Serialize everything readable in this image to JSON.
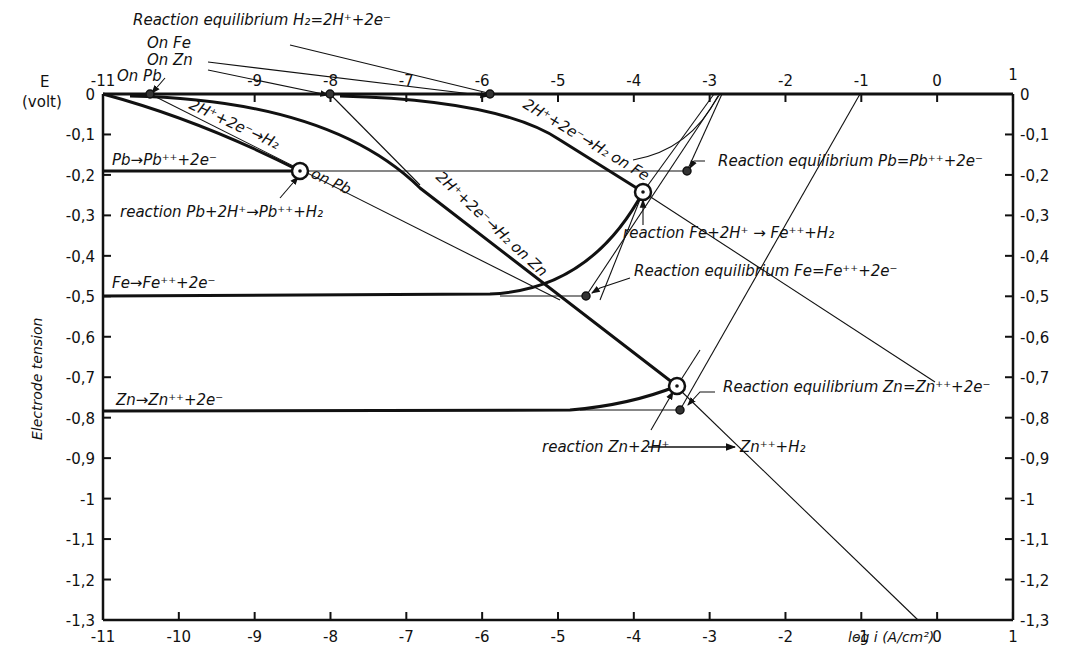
{
  "chart_data": {
    "type": "line",
    "title": "",
    "xlabel": "log i (A/cm²)",
    "ylabel": "Electrode tension",
    "y_unit_label": "E (volt)",
    "xlim": [
      -11,
      1
    ],
    "ylim": [
      -1.3,
      0
    ],
    "grid": false,
    "x_ticks_bottom": [
      "-11",
      "-10",
      "-9",
      "-8",
      "-7",
      "-6",
      "-5",
      "-4",
      "-3",
      "-2",
      "-1",
      "0",
      "1"
    ],
    "x_ticks_top": [
      "-11",
      "-9",
      "-8",
      "-7",
      "-6",
      "-5",
      "-4",
      "-3",
      "-2",
      "-1",
      "0",
      "1"
    ],
    "y_ticks_left": [
      "0",
      "-0,1",
      "-0,2",
      "-0,3",
      "-0,4",
      "-0,5",
      "-0,6",
      "-0,7",
      "-0,8",
      "-0,9",
      "-1",
      "-1,1",
      "-1,2",
      "-1,3"
    ],
    "y_ticks_right": [
      "0",
      "-0,1",
      "-0,2",
      "-0,3",
      "-0,4",
      "-0,5",
      "-0,6",
      "-0,7",
      "-0,8",
      "-0,9",
      "-1",
      "-1,1",
      "-1,2",
      "-1,3"
    ],
    "series": [
      {
        "name": "2H+ + 2e- → H2 on Pb",
        "x": [
          -10.4,
          -9.5,
          -8.4,
          -5.0
        ],
        "y": [
          0,
          -0.08,
          -0.19,
          -0.48
        ]
      },
      {
        "name": "2H+ + 2e- → H2 on Zn",
        "x": [
          -8.0,
          -7.0,
          -5.0,
          -3.4,
          -0.2
        ],
        "y": [
          0,
          -0.18,
          -0.53,
          -0.75,
          -1.3
        ]
      },
      {
        "name": "2H+ + 2e- → H2 on Fe",
        "x": [
          -5.8,
          -4.8,
          -3.8,
          -1.2
        ],
        "y": [
          0,
          -0.14,
          -0.24,
          -0.55
        ]
      },
      {
        "name": "Pb → Pb++ + 2e-",
        "x": [
          -11,
          -8.4,
          -3.3
        ],
        "y": [
          -0.19,
          -0.19,
          -0.19
        ]
      },
      {
        "name": "Fe → Fe++ + 2e-",
        "x": [
          -11,
          -5.0,
          -3.8
        ],
        "y": [
          -0.5,
          -0.49,
          -0.24
        ]
      },
      {
        "name": "Zn → Zn++ + 2e-",
        "x": [
          -11,
          -4.5,
          -3.4
        ],
        "y": [
          -0.82,
          -0.81,
          -0.75
        ]
      }
    ],
    "points": [
      {
        "name": "Pb corrosion point",
        "x": -8.4,
        "y": -0.19
      },
      {
        "name": "Fe corrosion point",
        "x": -3.8,
        "y": -0.24
      },
      {
        "name": "Zn corrosion point",
        "x": -3.4,
        "y": -0.75
      },
      {
        "name": "H2 equilibrium on Pb",
        "x": -10.4,
        "y": 0
      },
      {
        "name": "H2 equilibrium on Zn",
        "x": -8.0,
        "y": 0
      },
      {
        "name": "H2 equilibrium on Fe",
        "x": -5.8,
        "y": 0
      },
      {
        "name": "Pb equilibrium",
        "x": -3.3,
        "y": -0.19
      },
      {
        "name": "Fe equilibrium",
        "x": -4.6,
        "y": -0.5
      },
      {
        "name": "Zn equilibrium",
        "x": -3.3,
        "y": -0.82
      }
    ],
    "annotations": [
      "Reaction equilibrium H₂=2H⁺+2e⁻",
      "On Fe",
      "On Zn",
      "On Pb",
      "2H⁺+2e⁻→H₂ on Pb",
      "2H⁺+2e⁻→H₂ on Fe",
      "2H⁺+2e⁻→H₂ on Zn",
      "Pb→Pb⁺⁺+2e⁻",
      "Fe→Fe⁺⁺+2e⁻",
      "Zn→Zn⁺⁺+2e⁻",
      "reaction Pb+2H⁺→Pb⁺⁺+H₂",
      "reaction Fe+2H⁺→Fe⁺⁺+H₂",
      "reaction Zn+2H⁺→Zn⁺⁺+H₂",
      "Reaction equilibrium Pb=Pb⁺⁺+2e⁻",
      "Reaction equilibrium Fe=Fe⁺⁺+2e⁻",
      "Reaction equilibrium Zn=Zn⁺⁺+2e⁻"
    ]
  },
  "labels": {
    "e_axis": "E",
    "volt": "(volt)",
    "ylabel": "Electrode tension",
    "xlabel": "log i (A/cm²)",
    "h2_eq": "Reaction equilibrium H₂=2H⁺+2e⁻",
    "on_fe": "On Fe",
    "on_zn": "On Zn",
    "on_pb": "On Pb",
    "h2_on_pb": "2H⁺+2e⁻→H₂",
    "on_pb_small": "on Pb",
    "h2_on_fe": "2H⁺+2e⁻→H₂ on Fe",
    "h2_on_zn": "2H⁺+2e⁻→H₂ on Zn",
    "pb_anodic": "Pb→Pb⁺⁺+2e⁻",
    "fe_anodic": "Fe→Fe⁺⁺+2e⁻",
    "zn_anodic": "Zn→Zn⁺⁺+2e⁻",
    "pb_reaction": "reaction Pb+2H⁺→Pb⁺⁺+H₂",
    "fe_reaction": "reaction Fe+2H⁺ → Fe⁺⁺+H₂",
    "zn_reaction_a": "reaction Zn+2H⁺",
    "zn_reaction_b": "Zn⁺⁺+H₂",
    "pb_eq": "Reaction equilibrium Pb=Pb⁺⁺+2e⁻",
    "fe_eq": "Reaction equilibrium Fe=Fe⁺⁺+2e⁻",
    "zn_eq": "Reaction equilibrium Zn=Zn⁺⁺+2e⁻"
  },
  "ticks": {
    "bottom": [
      "-11",
      "-10",
      "-9",
      "-8",
      "-7",
      "-6",
      "-5",
      "-4",
      "-3",
      "-2",
      "-1",
      "0",
      "1"
    ],
    "top": [
      "-11",
      "-9",
      "-8",
      "-7",
      "-6",
      "-5",
      "-4",
      "-3",
      "-2",
      "-1",
      "0",
      "1"
    ],
    "left": [
      "0",
      "-0,1",
      "-0,2",
      "-0,3",
      "-0,4",
      "-0,5",
      "-0,6",
      "-0,7",
      "-0,8",
      "-0,9",
      "-1",
      "-1,1",
      "-1,2",
      "-1,3"
    ],
    "right": [
      "0",
      "-0,1",
      "-0,2",
      "-0,3",
      "-0,4",
      "-0,5",
      "-0,6",
      "-0,7",
      "-0,8",
      "-0,9",
      "-1",
      "-1,1",
      "-1,2",
      "-1,3"
    ]
  }
}
